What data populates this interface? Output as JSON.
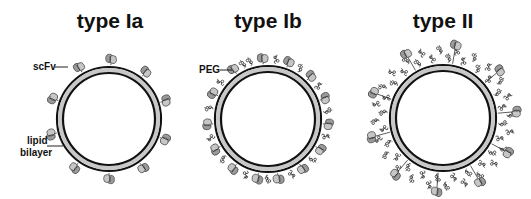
{
  "figure": {
    "panels": [
      {
        "id": "type-ia",
        "title": "type Ia",
        "title_x": 110,
        "center": [
          109,
          119
        ],
        "radius": 51,
        "scfv_angles": [
          -88,
          -120,
          -52,
          -18,
          -160,
          20,
          165,
          125,
          55,
          90
        ],
        "scfv_distance": 9,
        "peg_angles": [],
        "peg_layers": 0
      },
      {
        "id": "type-ib",
        "title": "type Ib",
        "title_x": 268,
        "center": [
          268,
          119
        ],
        "radius": 52,
        "scfv_angles": [
          -95,
          -70,
          -45,
          -20,
          5,
          30,
          55,
          80,
          100,
          125,
          150,
          175,
          -155,
          -125
        ],
        "scfv_distance": 9,
        "peg_angles": [
          -108,
          -82,
          -58,
          -33,
          -8,
          17,
          42,
          67,
          90,
          112,
          138,
          162,
          -170,
          -142,
          -115
        ],
        "peg_layers": 1
      },
      {
        "id": "type-ii",
        "title": "type II",
        "title_x": 443,
        "center": [
          443,
          118
        ],
        "radius": 52,
        "scfv_angles": [
          -80,
          -40,
          -5,
          28,
          60,
          95,
          130,
          165,
          -160,
          -120
        ],
        "scfv_distance": 22,
        "peg_angles": [
          -175,
          -160,
          -145,
          -130,
          -115,
          -100,
          -85,
          -70,
          -55,
          -40,
          -25,
          -10,
          5,
          20,
          35,
          50,
          65,
          80,
          95,
          110,
          125,
          140,
          155,
          170
        ],
        "peg_layers": 2
      }
    ],
    "labels": [
      {
        "id": "scfv",
        "text": "scFv",
        "x": 33,
        "y": 70,
        "line": [
          55,
          67,
          68,
          67
        ]
      },
      {
        "id": "lipid",
        "text": "lipid",
        "x": 27,
        "y": 144,
        "line": [
          46,
          143,
          62,
          146
        ]
      },
      {
        "id": "bilayer",
        "text": "bilayer",
        "x": 20,
        "y": 156,
        "line": []
      },
      {
        "id": "peg",
        "text": "PEG",
        "x": 201,
        "y": 73,
        "line": [
          220,
          70,
          232,
          70
        ]
      }
    ]
  }
}
